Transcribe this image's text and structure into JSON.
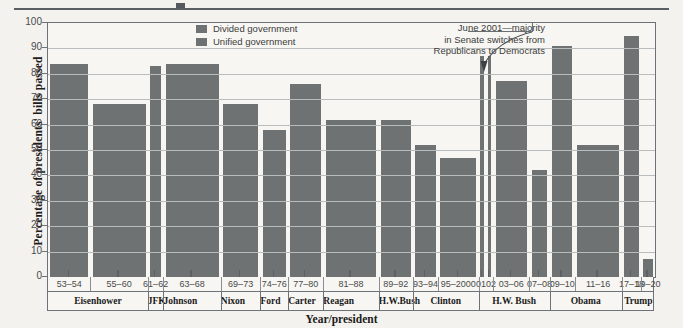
{
  "chart_data": {
    "type": "bar",
    "title": "",
    "xlabel": "Year/president",
    "ylabel": "Percentage of presidents' bills passed",
    "ylim": [
      0,
      100
    ],
    "ytick_labels": [
      "0",
      "10",
      "20",
      "30",
      "40",
      "50",
      "60",
      "70",
      "80",
      "90",
      "100"
    ],
    "grid": true,
    "legend_position": "top-center",
    "legend": [
      {
        "label": "Divided government",
        "color": "#6f7273"
      },
      {
        "label": "Unified government",
        "color": "#6f7273"
      }
    ],
    "annotations": [
      {
        "text_lines": [
          "June 2001—majority",
          "in Senate switches from",
          "Republicans to Democrats"
        ],
        "points_to": "0102"
      }
    ],
    "categories": [
      "53–54",
      "55–60",
      "61–62",
      "63–68",
      "69–73",
      "74–76",
      "77–80",
      "81–88",
      "89–92",
      "93–94",
      "95–2000",
      "01",
      "02",
      "03–06",
      "07–08",
      "09–10",
      "11–16",
      "17–18",
      "19–20"
    ],
    "values": [
      84,
      68,
      83,
      84,
      68,
      58,
      76,
      62,
      62,
      52,
      47,
      87,
      87,
      77,
      42,
      91,
      52,
      95,
      7
    ],
    "government": [
      "unified",
      "unified",
      "unified",
      "unified",
      "divided",
      "divided",
      "unified",
      "divided",
      "divided",
      "unified",
      "divided",
      "divided",
      "divided",
      "unified",
      "divided",
      "unified",
      "divided",
      "unified",
      "divided"
    ],
    "presidents": [
      {
        "name": "Eisenhower",
        "years": [
          "53–54",
          "55–60"
        ]
      },
      {
        "name": "JFK",
        "years": [
          "61–62"
        ]
      },
      {
        "name": "Johnson",
        "years": [
          "63–68"
        ]
      },
      {
        "name": "Nixon",
        "years": [
          "69–73"
        ]
      },
      {
        "name": "Ford",
        "years": [
          "74–76"
        ]
      },
      {
        "name": "Carter",
        "years": [
          "77–80"
        ]
      },
      {
        "name": "Reagan",
        "years": [
          "81–88"
        ]
      },
      {
        "name": "H.W.Bush",
        "years": [
          "89–92"
        ]
      },
      {
        "name": "Clinton",
        "years": [
          "93–94",
          "95–2000"
        ]
      },
      {
        "name": "H.W. Bush",
        "years": [
          "01",
          "02",
          "03–06",
          "07–08"
        ]
      },
      {
        "name": "Obama",
        "years": [
          "09–10",
          "11–16"
        ]
      },
      {
        "name": "Trump",
        "years": [
          "17–18",
          "19–20"
        ]
      }
    ]
  },
  "axis": {
    "y_title": "Percentage of presidents' bills passed",
    "x_title": "Year/president",
    "ticks": [
      "100",
      "90",
      "80",
      "70",
      "60",
      "50",
      "40",
      "30",
      "20",
      "10",
      "0"
    ]
  },
  "legend": {
    "divided": "Divided government",
    "unified": "Unified government"
  },
  "annotation": {
    "line1": "June 2001—majority",
    "line2": "in Senate switches from",
    "line3": "Republicans to Democrats"
  },
  "year_cells": [
    {
      "label": "53–54",
      "span": 1
    },
    {
      "label": "55–60",
      "span": 1
    },
    {
      "label": "61–62",
      "span": 1
    },
    {
      "label": "63–68",
      "span": 1
    },
    {
      "label": "69–73",
      "span": 1
    },
    {
      "label": "74–76",
      "span": 1
    },
    {
      "label": "77–80",
      "span": 1
    },
    {
      "label": "81–88",
      "span": 1
    },
    {
      "label": "89–92",
      "span": 1
    },
    {
      "label": "93–94",
      "span": 1
    },
    {
      "label": "95–2000",
      "span": 1
    },
    {
      "label": "0102",
      "span": 1
    },
    {
      "label": "03–06",
      "span": 1
    },
    {
      "label": "07–08",
      "span": 1
    },
    {
      "label": "09–10",
      "span": 1
    },
    {
      "label": "11–16",
      "span": 1
    },
    {
      "label": "17–18",
      "span": 1
    },
    {
      "label": "19–20",
      "span": 1
    }
  ],
  "president_cells": [
    "Eisenhower",
    "JFK",
    "Johnson",
    "Nixon",
    "Ford",
    "Carter",
    "Reagan",
    "H.W.Bush",
    "Clinton",
    "H.W. Bush",
    "Obama",
    "Trump"
  ],
  "colors": {
    "bar": "#6f7273",
    "plot_bg": "#f7f6f2",
    "page_bg": "#f4f2ee",
    "axis": "#6d7278",
    "grid": "#b9bcbd"
  }
}
